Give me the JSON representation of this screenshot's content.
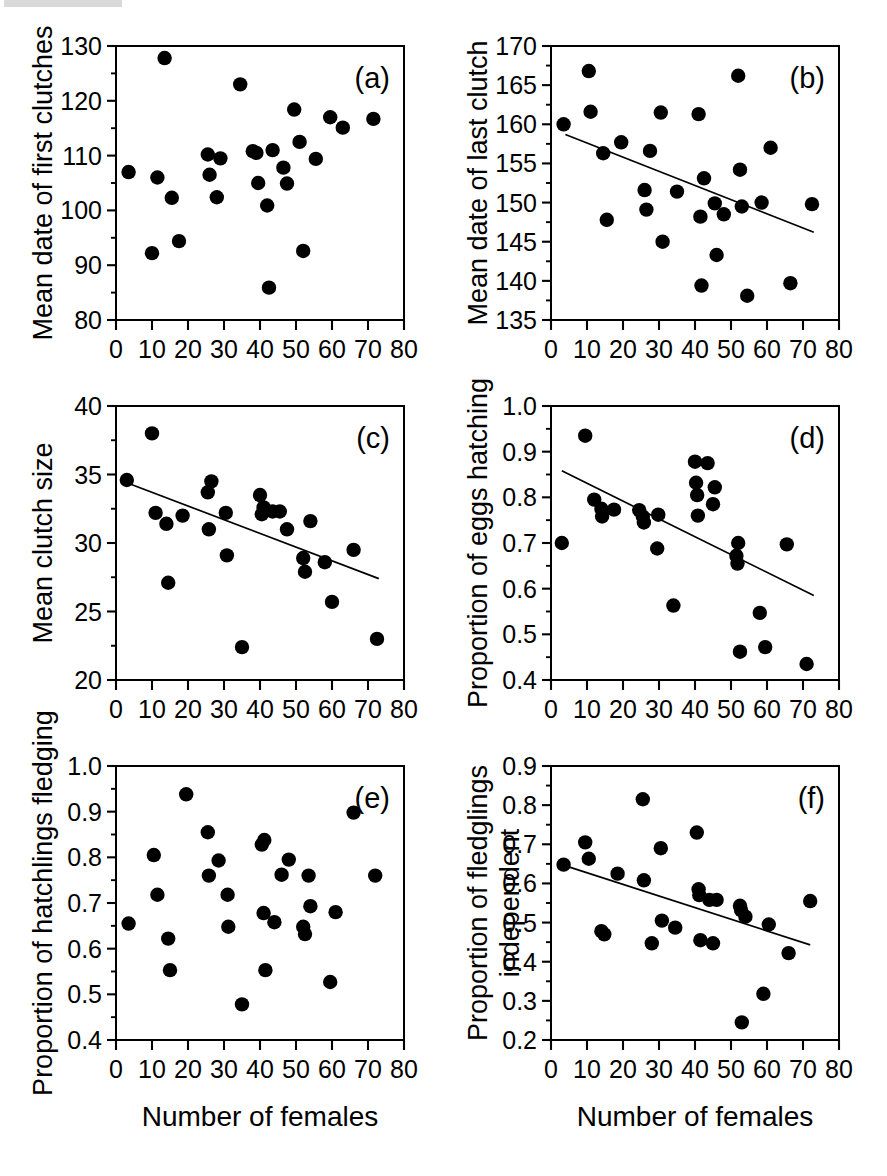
{
  "figure": {
    "layout": "2 columns x 3 rows of scatter plots",
    "shared_xlabel": "Number of females",
    "xaxis": {
      "label": "Number of females",
      "min": 0,
      "max": 80,
      "ticks": [
        0,
        10,
        20,
        30,
        40,
        50,
        60,
        70,
        80
      ],
      "ticklabels": [
        "0",
        "10",
        "20",
        "30",
        "40",
        "50",
        "60",
        "70",
        "80"
      ]
    }
  },
  "chart_data": [
    {
      "id": "a",
      "type": "scatter",
      "panel_letter": "(a)",
      "title": "",
      "xlabel": "Number of females",
      "ylabel": "Mean date of first clutches",
      "xlim": [
        0,
        80
      ],
      "ylim": [
        80,
        130
      ],
      "xticks": [
        0,
        10,
        20,
        30,
        40,
        50,
        60,
        70,
        80
      ],
      "yticks": [
        80,
        90,
        100,
        110,
        120,
        130
      ],
      "yticklabels": [
        "80",
        "90",
        "100",
        "110",
        "120",
        "130"
      ],
      "grid": false,
      "legend": "none",
      "regression_line": null,
      "points": [
        [
          3.5,
          107.0
        ],
        [
          10.0,
          92.2
        ],
        [
          11.5,
          106.0
        ],
        [
          13.5,
          127.8
        ],
        [
          15.5,
          102.3
        ],
        [
          17.5,
          94.4
        ],
        [
          25.5,
          110.2
        ],
        [
          26.0,
          106.5
        ],
        [
          28.0,
          102.4
        ],
        [
          29.0,
          109.5
        ],
        [
          34.5,
          123.0
        ],
        [
          38.0,
          110.8
        ],
        [
          39.0,
          110.5
        ],
        [
          39.5,
          105.0
        ],
        [
          42.0,
          100.9
        ],
        [
          42.5,
          85.9
        ],
        [
          43.5,
          111.0
        ],
        [
          46.5,
          107.8
        ],
        [
          47.5,
          104.9
        ],
        [
          49.5,
          118.4
        ],
        [
          51.0,
          112.5
        ],
        [
          52.0,
          92.6
        ],
        [
          55.5,
          109.4
        ],
        [
          59.5,
          117.0
        ],
        [
          63.0,
          115.1
        ],
        [
          71.5,
          116.7
        ]
      ]
    },
    {
      "id": "b",
      "type": "scatter",
      "panel_letter": "(b)",
      "title": "",
      "xlabel": "Number of females",
      "ylabel": "Mean date of last clutch",
      "xlim": [
        0,
        80
      ],
      "ylim": [
        135,
        170
      ],
      "xticks": [
        0,
        10,
        20,
        30,
        40,
        50,
        60,
        70,
        80
      ],
      "yticks": [
        135,
        140,
        145,
        150,
        155,
        160,
        165,
        170
      ],
      "yticklabels": [
        "135",
        "140",
        "145",
        "150",
        "155",
        "160",
        "165",
        "170"
      ],
      "grid": false,
      "legend": "none",
      "regression_line": {
        "x0": 4,
        "y0": 158.7,
        "x1": 73,
        "y1": 146.2
      },
      "points": [
        [
          3.5,
          160.0
        ],
        [
          10.5,
          166.8
        ],
        [
          11.0,
          161.6
        ],
        [
          14.5,
          156.3
        ],
        [
          15.5,
          147.8
        ],
        [
          19.5,
          157.7
        ],
        [
          26.0,
          151.6
        ],
        [
          26.5,
          149.1
        ],
        [
          27.5,
          156.6
        ],
        [
          30.5,
          161.5
        ],
        [
          31.0,
          145.0
        ],
        [
          35.0,
          151.4
        ],
        [
          41.0,
          161.3
        ],
        [
          41.5,
          148.2
        ],
        [
          41.8,
          139.4
        ],
        [
          42.5,
          153.1
        ],
        [
          45.5,
          149.9
        ],
        [
          46.0,
          143.3
        ],
        [
          48.0,
          148.5
        ],
        [
          52.0,
          166.2
        ],
        [
          53.0,
          149.5
        ],
        [
          54.5,
          138.1
        ],
        [
          52.5,
          154.2
        ],
        [
          58.5,
          150.0
        ],
        [
          61.0,
          157.0
        ],
        [
          66.5,
          139.7
        ],
        [
          72.5,
          149.8
        ]
      ]
    },
    {
      "id": "c",
      "type": "scatter",
      "panel_letter": "(c)",
      "title": "",
      "xlabel": "Number of females",
      "ylabel": "Mean clutch size",
      "xlim": [
        0,
        80
      ],
      "ylim": [
        20,
        40
      ],
      "xticks": [
        0,
        10,
        20,
        30,
        40,
        50,
        60,
        70,
        80
      ],
      "yticks": [
        20,
        25,
        30,
        35,
        40
      ],
      "yticklabels": [
        "20",
        "25",
        "30",
        "35",
        "40"
      ],
      "grid": false,
      "legend": "none",
      "regression_line": {
        "x0": 3,
        "y0": 34.4,
        "x1": 73,
        "y1": 27.4
      },
      "points": [
        [
          3.0,
          34.6
        ],
        [
          10.0,
          38.0
        ],
        [
          11.0,
          32.2
        ],
        [
          14.0,
          31.4
        ],
        [
          14.5,
          27.1
        ],
        [
          18.5,
          32.0
        ],
        [
          25.5,
          33.7
        ],
        [
          25.8,
          31.0
        ],
        [
          26.5,
          34.5
        ],
        [
          30.5,
          32.2
        ],
        [
          30.8,
          29.1
        ],
        [
          35.0,
          22.4
        ],
        [
          40.0,
          33.5
        ],
        [
          40.5,
          32.1
        ],
        [
          41.0,
          32.6
        ],
        [
          43.5,
          32.3
        ],
        [
          45.5,
          32.3
        ],
        [
          47.5,
          31.0
        ],
        [
          52.0,
          28.9
        ],
        [
          52.5,
          27.9
        ],
        [
          54.0,
          31.6
        ],
        [
          58.0,
          28.6
        ],
        [
          60.0,
          25.7
        ],
        [
          66.0,
          29.5
        ],
        [
          72.5,
          23.0
        ]
      ]
    },
    {
      "id": "d",
      "type": "scatter",
      "panel_letter": "(d)",
      "title": "",
      "xlabel": "Number of females",
      "ylabel": "Proportion of eggs hatching",
      "xlim": [
        0,
        80
      ],
      "ylim": [
        0.4,
        1.0
      ],
      "xticks": [
        0,
        10,
        20,
        30,
        40,
        50,
        60,
        70,
        80
      ],
      "yticks": [
        0.4,
        0.5,
        0.6,
        0.7,
        0.8,
        0.9,
        1.0
      ],
      "yticklabels": [
        "0.4",
        "0.5",
        "0.6",
        "0.7",
        "0.8",
        "0.9",
        "1.0"
      ],
      "grid": false,
      "legend": "none",
      "regression_line": {
        "x0": 3,
        "y0": 0.858,
        "x1": 73,
        "y1": 0.585
      },
      "points": [
        [
          3.0,
          0.7
        ],
        [
          9.5,
          0.935
        ],
        [
          12.0,
          0.795
        ],
        [
          14.0,
          0.775
        ],
        [
          14.2,
          0.758
        ],
        [
          17.5,
          0.773
        ],
        [
          24.5,
          0.772
        ],
        [
          25.5,
          0.758
        ],
        [
          25.8,
          0.745
        ],
        [
          29.5,
          0.688
        ],
        [
          29.8,
          0.762
        ],
        [
          34.0,
          0.563
        ],
        [
          40.0,
          0.878
        ],
        [
          40.3,
          0.832
        ],
        [
          40.6,
          0.805
        ],
        [
          40.8,
          0.76
        ],
        [
          43.5,
          0.875
        ],
        [
          45.5,
          0.822
        ],
        [
          45.0,
          0.785
        ],
        [
          52.0,
          0.7
        ],
        [
          51.5,
          0.672
        ],
        [
          51.8,
          0.655
        ],
        [
          52.5,
          0.462
        ],
        [
          58.0,
          0.547
        ],
        [
          59.5,
          0.472
        ],
        [
          65.5,
          0.697
        ],
        [
          71.0,
          0.435
        ]
      ]
    },
    {
      "id": "e",
      "type": "scatter",
      "panel_letter": "(e)",
      "title": "",
      "xlabel": "Number of females",
      "ylabel": "Proportion of hatchlings fledging",
      "xlim": [
        0,
        80
      ],
      "ylim": [
        0.4,
        1.0
      ],
      "xticks": [
        0,
        10,
        20,
        30,
        40,
        50,
        60,
        70,
        80
      ],
      "yticks": [
        0.4,
        0.5,
        0.6,
        0.7,
        0.8,
        0.9,
        1.0
      ],
      "yticklabels": [
        "0.4",
        "0.5",
        "0.6",
        "0.7",
        "0.8",
        "0.9",
        "1.0"
      ],
      "grid": false,
      "legend": "none",
      "regression_line": null,
      "points": [
        [
          3.5,
          0.655
        ],
        [
          10.5,
          0.805
        ],
        [
          11.5,
          0.718
        ],
        [
          14.5,
          0.622
        ],
        [
          15.0,
          0.553
        ],
        [
          19.5,
          0.938
        ],
        [
          25.5,
          0.855
        ],
        [
          25.8,
          0.76
        ],
        [
          28.5,
          0.793
        ],
        [
          31.0,
          0.718
        ],
        [
          31.2,
          0.648
        ],
        [
          35.0,
          0.478
        ],
        [
          40.5,
          0.828
        ],
        [
          41.2,
          0.838
        ],
        [
          41.0,
          0.678
        ],
        [
          41.5,
          0.553
        ],
        [
          44.0,
          0.658
        ],
        [
          46.0,
          0.762
        ],
        [
          48.0,
          0.795
        ],
        [
          52.0,
          0.648
        ],
        [
          52.5,
          0.632
        ],
        [
          53.5,
          0.76
        ],
        [
          54.0,
          0.693
        ],
        [
          59.5,
          0.527
        ],
        [
          61.0,
          0.68
        ],
        [
          66.0,
          0.898
        ],
        [
          72.0,
          0.76
        ]
      ]
    },
    {
      "id": "f",
      "type": "scatter",
      "panel_letter": "(f)",
      "title": "",
      "xlabel": "Number of females",
      "ylabel": "Proportion of fledglings independent",
      "ylabel_lines": [
        "Proportion of fledglings",
        "independent"
      ],
      "xlim": [
        0,
        80
      ],
      "ylim": [
        0.2,
        0.9
      ],
      "xticks": [
        0,
        10,
        20,
        30,
        40,
        50,
        60,
        70,
        80
      ],
      "yticks": [
        0.2,
        0.3,
        0.4,
        0.5,
        0.6,
        0.7,
        0.8,
        0.9
      ],
      "yticklabels": [
        "0.2",
        "0.3",
        "0.4",
        "0.5",
        "0.6",
        "0.7",
        "0.8",
        "0.9"
      ],
      "grid": false,
      "legend": "none",
      "regression_line": {
        "x0": 3,
        "y0": 0.648,
        "x1": 72,
        "y1": 0.443
      },
      "points": [
        [
          3.5,
          0.648
        ],
        [
          9.5,
          0.705
        ],
        [
          10.5,
          0.663
        ],
        [
          14.0,
          0.478
        ],
        [
          14.8,
          0.47
        ],
        [
          18.5,
          0.625
        ],
        [
          25.5,
          0.815
        ],
        [
          25.8,
          0.608
        ],
        [
          28.0,
          0.447
        ],
        [
          30.5,
          0.69
        ],
        [
          30.8,
          0.505
        ],
        [
          34.5,
          0.487
        ],
        [
          40.5,
          0.73
        ],
        [
          41.0,
          0.585
        ],
        [
          41.2,
          0.57
        ],
        [
          41.5,
          0.455
        ],
        [
          44.0,
          0.558
        ],
        [
          45.0,
          0.447
        ],
        [
          46.0,
          0.558
        ],
        [
          52.5,
          0.543
        ],
        [
          52.8,
          0.532
        ],
        [
          53.0,
          0.245
        ],
        [
          54.0,
          0.515
        ],
        [
          59.0,
          0.318
        ],
        [
          60.5,
          0.495
        ],
        [
          66.0,
          0.422
        ],
        [
          72.0,
          0.555
        ]
      ]
    }
  ]
}
